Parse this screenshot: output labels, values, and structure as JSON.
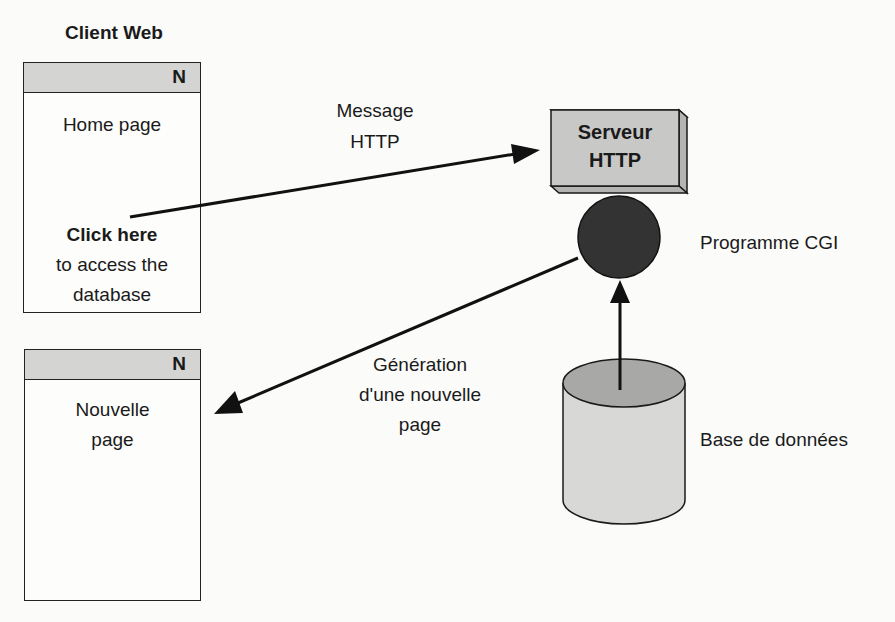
{
  "client": {
    "title": "Client Web",
    "home_window": {
      "header_badge": "N",
      "title": "Home page",
      "link_label": "Click here",
      "link_desc_line1": "to access the",
      "link_desc_line2": "database"
    },
    "new_window": {
      "header_badge": "N",
      "title_line1": "Nouvelle",
      "title_line2": "page"
    }
  },
  "server": {
    "label_line1": "Serveur",
    "label_line2": "HTTP"
  },
  "cgi": {
    "label": "Programme CGI"
  },
  "database": {
    "label": "Base de données"
  },
  "arrows": {
    "request": {
      "label_line1": "Message",
      "label_line2": "HTTP"
    },
    "response": {
      "label_line1": "Génération",
      "label_line2": "d'une nouvelle",
      "label_line3": "page"
    }
  },
  "colors": {
    "header_gray": "#d4d4d2",
    "server_gray": "#c8c8c6",
    "cgi_dark": "#333333",
    "db_body": "#d8d8d6",
    "db_top": "#a8a8a6",
    "stroke": "#1a1a1a"
  }
}
